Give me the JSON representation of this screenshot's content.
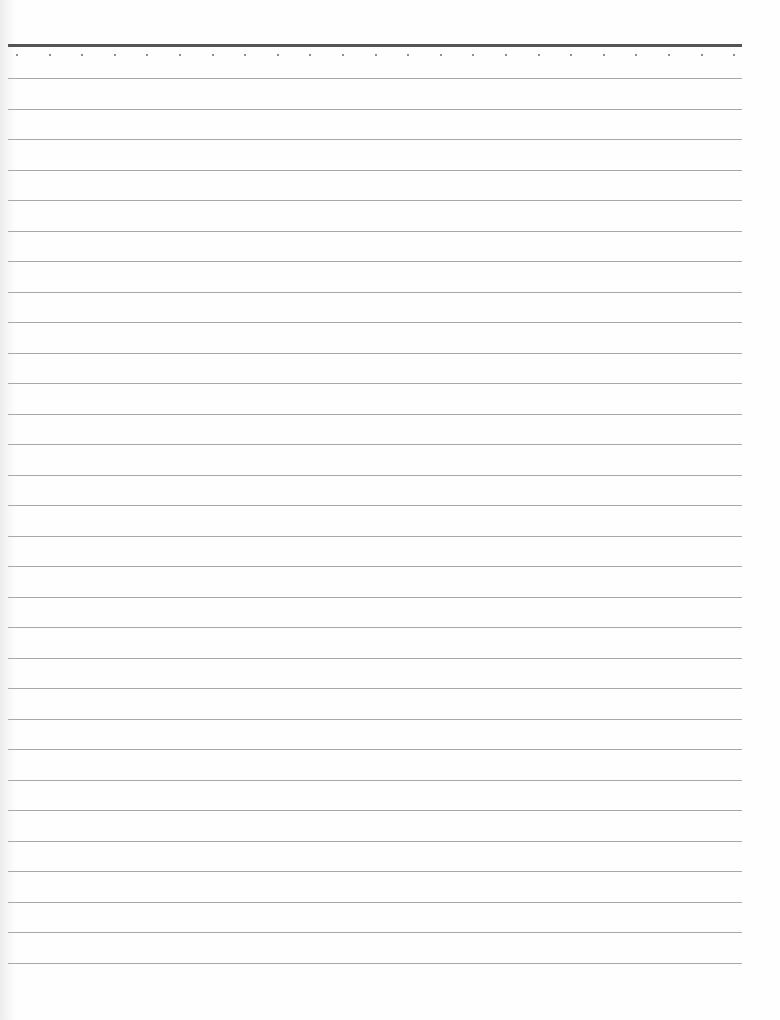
{
  "page": {
    "type": "blank lined notebook paper",
    "colors": {
      "paper": "#fefefe",
      "top_rule": "#555555",
      "ruled_line": "#a8a8a8",
      "dot": "#6a6a6a"
    },
    "top_rule": {
      "x": 8,
      "y": 44,
      "width": 734
    },
    "dots": {
      "count": 23,
      "y": 54,
      "x_start": 16,
      "spacing": 32.6
    },
    "ruled_lines": {
      "count": 30,
      "y_start": 78,
      "spacing": 30.5,
      "x": 8,
      "width": 734
    },
    "text": []
  }
}
